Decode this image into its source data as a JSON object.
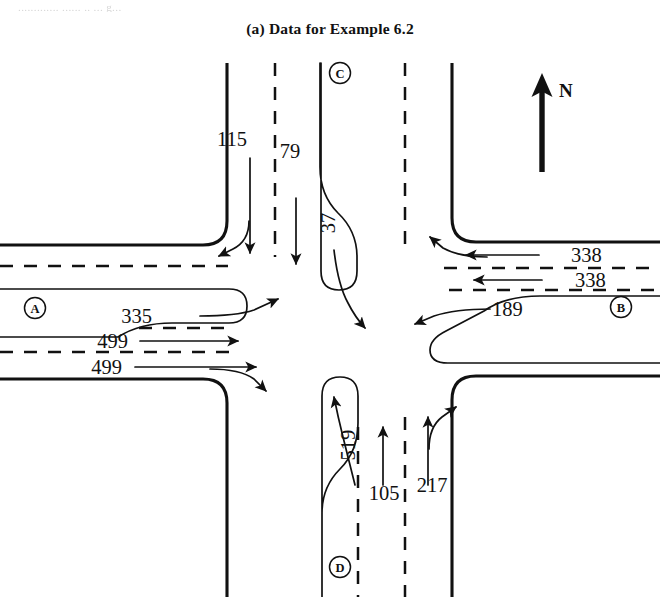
{
  "page": {
    "ghost_text_fragment": "............. ...... .. ... g...",
    "caption": "(a)  Data for Example 6.2"
  },
  "figure": {
    "type": "intersection-turning-movement-diagram",
    "north_arrow_label": "N",
    "approaches": [
      {
        "id": "A",
        "node_label": "A",
        "side": "west",
        "movements": [
          {
            "name": "left-turn",
            "volume": "335",
            "direction": "curve-right-up"
          },
          {
            "name": "through-upper",
            "volume": "499",
            "direction": "straight-east"
          },
          {
            "name": "through-right",
            "volume": "499",
            "direction": "straight-east-and-right-turn"
          }
        ]
      },
      {
        "id": "B",
        "node_label": "B",
        "side": "east",
        "movements": [
          {
            "name": "through-upper",
            "volume": "338",
            "direction": "straight-west-and-right-turn"
          },
          {
            "name": "through-lower",
            "volume": "338",
            "direction": "straight-west"
          },
          {
            "name": "left-turn",
            "volume": "189",
            "direction": "curve-left-west"
          }
        ]
      },
      {
        "id": "C",
        "node_label": "C",
        "side": "north",
        "movements": [
          {
            "name": "through-right",
            "volume": "115",
            "direction": "straight-south-and-right-turn"
          },
          {
            "name": "through",
            "volume": "79",
            "direction": "straight-south"
          },
          {
            "name": "left-turn",
            "volume": "37",
            "direction": "curve-south-east"
          }
        ]
      },
      {
        "id": "D",
        "node_label": "D",
        "side": "south",
        "movements": [
          {
            "name": "left-turn",
            "volume": "519",
            "direction": "curve-north-west"
          },
          {
            "name": "through",
            "volume": "105",
            "direction": "straight-north"
          },
          {
            "name": "through-right",
            "volume": "217",
            "direction": "straight-north-and-right-turn"
          }
        ]
      }
    ],
    "volume_labels": {
      "c_through_right": "115",
      "c_through": "79",
      "c_left": "37",
      "b_through_upper": "338",
      "b_through_lower": "338",
      "b_left": "189",
      "a_left": "335",
      "a_through_upper": "499",
      "a_through_lower": "499",
      "d_left": "519",
      "d_through": "105",
      "d_through_right": "217"
    },
    "colors": {
      "ink": "#111111",
      "paper": "#ffffff",
      "ghost": "#cfcfcf"
    }
  }
}
